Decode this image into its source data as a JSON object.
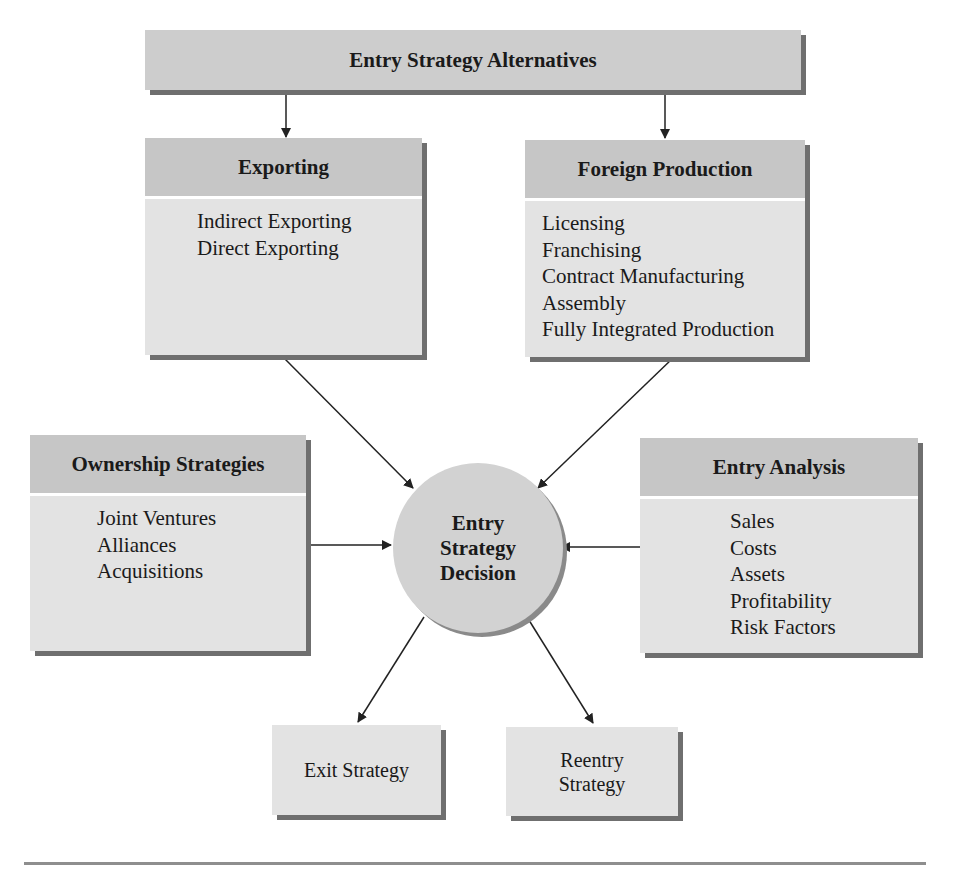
{
  "diagram": {
    "title": "Entry Strategy Alternatives",
    "exporting": {
      "heading": "Exporting",
      "items": [
        "Indirect Exporting",
        "Direct Exporting"
      ]
    },
    "foreign_production": {
      "heading": "Foreign Production",
      "items": [
        "Licensing",
        "Franchising",
        "Contract Manufacturing",
        "Assembly",
        "Fully Integrated Production"
      ]
    },
    "ownership": {
      "heading": "Ownership Strategies",
      "items": [
        "Joint Ventures",
        "Alliances",
        "Acquisitions"
      ]
    },
    "entry_analysis": {
      "heading": "Entry Analysis",
      "items": [
        "Sales",
        "Costs",
        "Assets",
        "Profitability",
        "Risk Factors"
      ]
    },
    "center": {
      "lines": [
        "Entry",
        "Strategy",
        "Decision"
      ]
    },
    "exit": {
      "lines": [
        "Exit Strategy"
      ]
    },
    "reentry": {
      "lines": [
        "Reentry",
        "Strategy"
      ]
    }
  },
  "colors": {
    "header_fill": "#c6c6c6",
    "body_fill": "#e3e3e3",
    "circle_fill": "#d2d2d2",
    "shadow": "#6f6f6f",
    "arrow": "#222222"
  }
}
